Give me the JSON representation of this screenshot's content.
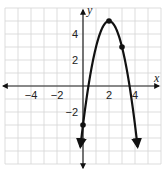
{
  "chart_data": {
    "type": "line",
    "title": "",
    "xlabel": "x",
    "ylabel": "y",
    "xlim": [
      -6,
      6
    ],
    "ylim": [
      -6,
      6
    ],
    "grid": true,
    "grid_step": 1,
    "x_ticks": [
      {
        "value": -4,
        "label": "−4"
      },
      {
        "value": -2,
        "label": "−2"
      },
      {
        "value": 2,
        "label": "2"
      },
      {
        "value": 4,
        "label": "4"
      }
    ],
    "y_ticks": [
      {
        "value": 4,
        "label": "4"
      },
      {
        "value": 2,
        "label": "2"
      },
      {
        "value": -2,
        "label": "−2"
      }
    ],
    "series": [
      {
        "name": "parabola",
        "equation": "y = -2(x - 2)^2 + 5",
        "a": -2,
        "h": 2,
        "k": 5,
        "x_range": [
          -0.2,
          4.2
        ],
        "arrows_at_ends": true,
        "color": "#111111"
      }
    ],
    "points": [
      {
        "x": 2,
        "y": 5,
        "label": "vertex"
      },
      {
        "x": 3,
        "y": 3,
        "label": ""
      },
      {
        "x": 0,
        "y": -3,
        "label": "y-intercept"
      }
    ]
  }
}
